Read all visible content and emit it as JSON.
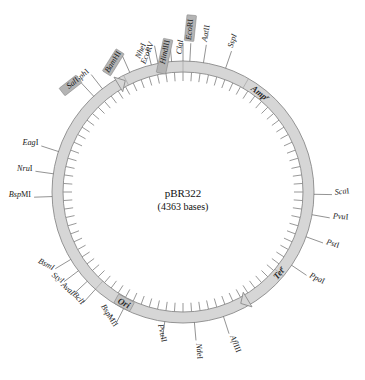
{
  "diagram": {
    "type": "plasmid-map",
    "center": {
      "name": "pBR322",
      "size": "(4363 bases)"
    },
    "colors": {
      "ring_fill": "#d6d6d6",
      "ring_stroke": "#8a8a8a",
      "highlight": "#b4b4b4",
      "text": "#1a1a1a",
      "leader": "#4a4a4a"
    },
    "genes": [
      {
        "name": "gene-amp",
        "label": "Amp",
        "superscript": "r",
        "angle": -52
      },
      {
        "name": "gene-tet",
        "label": "Tet",
        "superscript": "r",
        "angle": 40
      },
      {
        "name": "gene-ori",
        "label": "Ori",
        "superscript": "",
        "angle": 118
      }
    ],
    "sites": [
      {
        "name": "site-sspi",
        "label": "SspI",
        "italic": "SspI",
        "rest": "",
        "highlight": false,
        "angle": -71,
        "rot": -72
      },
      {
        "name": "site-aatii",
        "label": "AatII",
        "italic": "Aat",
        "rest": "II",
        "highlight": false,
        "angle": -81,
        "rot": -80
      },
      {
        "name": "site-ecori",
        "label": "EcoRI",
        "italic": "Eco",
        "rest": "RI",
        "highlight": true,
        "angle": -87,
        "rot": -84
      },
      {
        "name": "site-clai",
        "label": "ClaI",
        "italic": "ClaI",
        "rest": "",
        "highlight": false,
        "angle": -90,
        "rot": -84
      },
      {
        "name": "site-hindiii",
        "label": "HindIII",
        "italic": "Hin",
        "rest": "dIII",
        "highlight": true,
        "angle": -95,
        "rot": -78
      },
      {
        "name": "site-ecorv",
        "label": "EcoRV",
        "italic": "Eco",
        "rest": "RV",
        "highlight": false,
        "angle": -101,
        "rot": -68
      },
      {
        "name": "site-nhei",
        "label": "NheI",
        "italic": "Nhe",
        "rest": "I",
        "highlight": false,
        "angle": -104,
        "rot": -66
      },
      {
        "name": "site-bamhi",
        "label": "BamHI",
        "italic": "Bam",
        "rest": "HI",
        "highlight": true,
        "angle": -114,
        "rot": -58
      },
      {
        "name": "site-sphi",
        "label": "SphI",
        "italic": "Sph",
        "rest": "I",
        "highlight": false,
        "angle": -128,
        "rot": -42
      },
      {
        "name": "site-sali",
        "label": "SalI",
        "italic": "Sal",
        "rest": "I",
        "highlight": true,
        "angle": -133,
        "rot": -38
      },
      {
        "name": "site-eagi",
        "label": "EagI",
        "italic": "Eag",
        "rest": "I",
        "highlight": false,
        "angle": -162,
        "rot": 0
      },
      {
        "name": "site-nrui",
        "label": "NruI",
        "italic": "Nru",
        "rest": "I",
        "highlight": false,
        "angle": -172,
        "rot": 0
      },
      {
        "name": "site-bspmi",
        "label": "BspMI",
        "italic": "Bsp",
        "rest": "MI",
        "highlight": false,
        "angle": -182,
        "rot": 0
      },
      {
        "name": "site-bsmi",
        "label": "BsmI",
        "italic": "BsmI",
        "rest": "",
        "highlight": false,
        "angle": -211,
        "rot": 28
      },
      {
        "name": "site-styi",
        "label": "StyI",
        "italic": "StyI",
        "rest": "",
        "highlight": false,
        "angle": -217,
        "rot": 36
      },
      {
        "name": "site-avai",
        "label": "AvaI",
        "italic": "AvaI",
        "rest": "",
        "highlight": false,
        "angle": -223,
        "rot": 42
      },
      {
        "name": "site-bcli",
        "label": "BclI",
        "italic": "Bcl",
        "rest": "I",
        "highlight": false,
        "angle": -228,
        "rot": 48
      },
      {
        "name": "site-bspmii",
        "label": "BspMII",
        "italic": "Bsp",
        "rest": "MII",
        "highlight": false,
        "angle": -243,
        "rot": 58
      },
      {
        "name": "site-pvuii",
        "label": "PvuII",
        "italic": "Pvu",
        "rest": "II",
        "highlight": false,
        "angle": -262,
        "rot": 78
      },
      {
        "name": "site-ndei",
        "label": "NdeI",
        "italic": "Nde",
        "rest": "I",
        "highlight": false,
        "angle": -275,
        "rot": 86
      },
      {
        "name": "site-afliii",
        "label": "AflIII",
        "italic": "Afl",
        "rest": "III",
        "highlight": false,
        "angle": -288,
        "rot": 68
      },
      {
        "name": "site-ppai",
        "label": "PpaI",
        "italic": "Ppa",
        "rest": "I",
        "highlight": false,
        "angle": -326,
        "rot": 26
      },
      {
        "name": "site-psti",
        "label": "PstI",
        "italic": "Pst",
        "rest": "I",
        "highlight": false,
        "angle": -340,
        "rot": 18
      },
      {
        "name": "site-pvui",
        "label": "PvuI",
        "italic": "Pvu",
        "rest": "I",
        "highlight": false,
        "angle": -350,
        "rot": 4
      },
      {
        "name": "site-scai",
        "label": "ScaI",
        "italic": "Sca",
        "rest": "I",
        "highlight": false,
        "angle": -359,
        "rot": -6
      }
    ]
  }
}
